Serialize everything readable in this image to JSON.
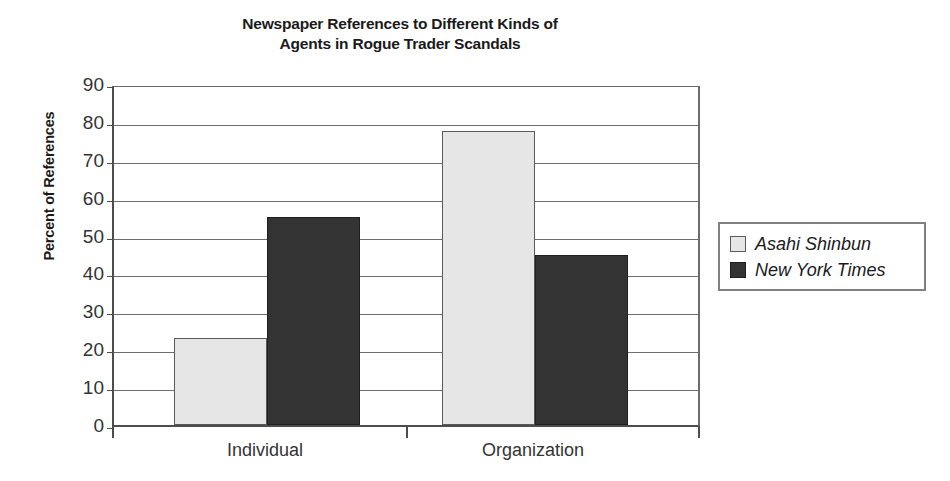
{
  "chart_data": {
    "type": "bar",
    "title": "Newspaper References to Different Kinds of Agents in Rogue Trader Scandals",
    "title_lines": [
      "Newspaper References to Different Kinds of",
      "Agents in Rogue Trader Scandals"
    ],
    "xlabel": "",
    "ylabel": "Percent of References",
    "categories": [
      "Individual",
      "Organization"
    ],
    "ylim": [
      0,
      90
    ],
    "ytick_step": 10,
    "yticks": [
      90,
      80,
      70,
      60,
      50,
      40,
      30,
      20,
      10,
      0
    ],
    "ytick_labels": [
      "90",
      "80",
      "70",
      "60",
      "50",
      "40",
      "30",
      "20",
      "10",
      "0"
    ],
    "grid": true,
    "grid_axis": "y",
    "legend_position": "right",
    "series": [
      {
        "name": "Asahi Shinbun",
        "values": [
          23,
          77.5
        ],
        "color": "#e6e6e6",
        "edge_color": "#5a5a5a"
      },
      {
        "name": "New York Times",
        "values": [
          55,
          45
        ],
        "color": "#333333",
        "edge_color": "#1f1f1f"
      }
    ]
  },
  "legend": {
    "items": [
      {
        "label": "Asahi Shinbun",
        "swatch": "light"
      },
      {
        "label": "New York Times",
        "swatch": "dark"
      }
    ]
  },
  "colors": {
    "background": "#ffffff",
    "axis": "#4d4d4d",
    "gridline": "#6e6e6e",
    "text": "#333333",
    "title_text": "#1a1a1a",
    "series_light": "#e6e6e6",
    "series_dark": "#333333"
  }
}
